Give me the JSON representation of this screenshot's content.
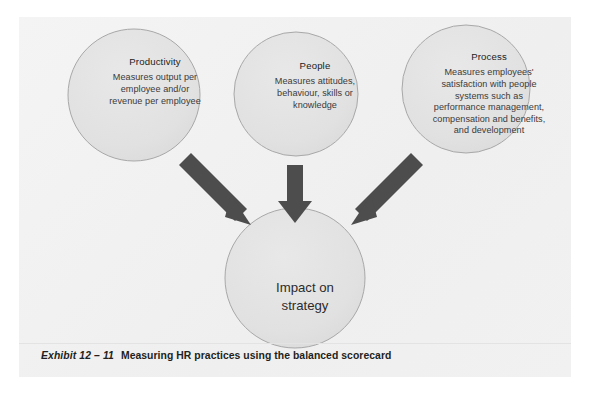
{
  "figure": {
    "background_color": "#f2f2f2",
    "nodes": [
      {
        "id": "productivity",
        "title": "Productivity",
        "lines": [
          "Measures output per",
          "employee and/or",
          "revenue per employee"
        ]
      },
      {
        "id": "people",
        "title": "People",
        "lines": [
          "Measures attitudes,",
          "behaviour, skills or",
          "knowledge"
        ]
      },
      {
        "id": "process",
        "title": "Process",
        "lines": [
          "Measures employees'",
          "satisfaction with people",
          "systems such as",
          "performance management,",
          "compensation and benefits,",
          "and development"
        ]
      }
    ],
    "outcome": {
      "id": "impact",
      "lines": [
        "Impact on",
        "strategy"
      ]
    },
    "arrows": [
      {
        "id": "arrow-productivity-to-impact",
        "direction": "down-right"
      },
      {
        "id": "arrow-people-to-impact",
        "direction": "down"
      },
      {
        "id": "arrow-process-to-impact",
        "direction": "down-left"
      }
    ],
    "colors": {
      "circle_fill": "#e2e2e2",
      "circle_stroke": "#a8a8a8",
      "arrow": "#4d4d4d",
      "text": "#2f2f2f",
      "panel": "#f2f2f2",
      "caption_text": "#231f20",
      "rule": "#e3e3e3"
    }
  },
  "caption": {
    "label": "Exhibit 12 – 11",
    "title": "Measuring HR practices using the balanced scorecard"
  }
}
